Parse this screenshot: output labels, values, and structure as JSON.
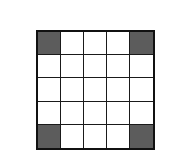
{
  "diagram": {
    "type": "grid",
    "rows": 5,
    "cols": 5,
    "shaded_color": "#5c5c5c",
    "empty_color": "#ffffff",
    "line_color": "#111111",
    "shaded_cells": [
      [
        0,
        0
      ],
      [
        0,
        4
      ],
      [
        4,
        0
      ],
      [
        4,
        4
      ]
    ]
  }
}
